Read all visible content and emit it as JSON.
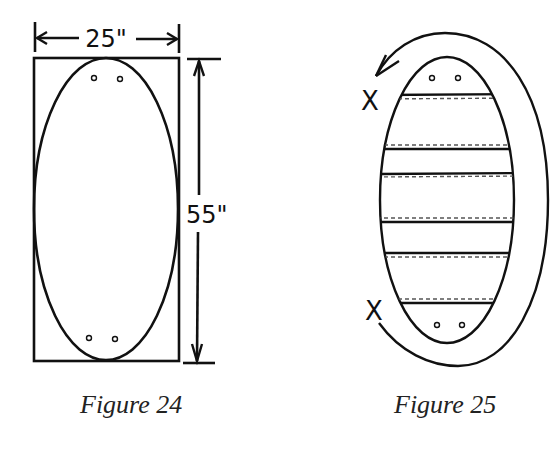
{
  "figures": [
    {
      "id": "figure-24",
      "caption": "Figure 24",
      "width_label": "25\"",
      "height_label": "55\"",
      "description": "Oval inscribed in a rectangle with two pairs of small holes at top and bottom"
    },
    {
      "id": "figure-25",
      "caption": "Figure 25",
      "x_marks": [
        "X",
        "X"
      ],
      "slat_count": 6,
      "description": "Oval with horizontal slats, dashed stitch lines, and a curved arrow wrapping around from bottom X to top X"
    }
  ],
  "colors": {
    "line": "#111111",
    "background": "#ffffff",
    "dashed": "#555555"
  }
}
